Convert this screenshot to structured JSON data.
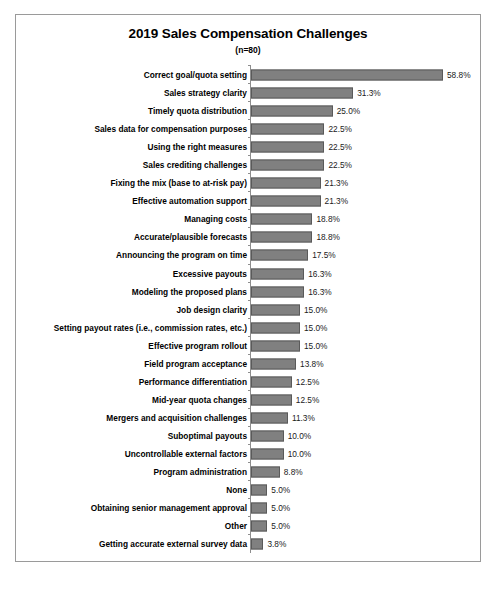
{
  "chart_data": {
    "type": "bar",
    "orientation": "horizontal",
    "title": "2019 Sales Compensation Challenges",
    "subtitle": "(n=80)",
    "xlabel": "",
    "ylabel": "",
    "xlim": [
      0,
      58.8
    ],
    "grid": false,
    "legend": null,
    "value_suffix": "%",
    "categories": [
      "Correct goal/quota setting",
      "Sales strategy clarity",
      "Timely quota distribution",
      "Sales data for compensation purposes",
      "Using the right measures",
      "Sales crediting challenges",
      "Fixing the mix (base to at-risk pay)",
      "Effective automation support",
      "Managing costs",
      "Accurate/plausible forecasts",
      "Announcing the program on time",
      "Excessive payouts",
      "Modeling the proposed plans",
      "Job design clarity",
      "Setting payout rates (i.e., commission rates, etc.)",
      "Effective program rollout",
      "Field program acceptance",
      "Performance differentiation",
      "Mid-year quota changes",
      "Mergers and acquisition challenges",
      "Suboptimal payouts",
      "Uncontrollable external factors",
      "Program administration",
      "None",
      "Obtaining senior management approval",
      "Other",
      "Getting accurate external survey data"
    ],
    "values": [
      58.8,
      31.3,
      25.0,
      22.5,
      22.5,
      22.5,
      21.3,
      21.3,
      18.8,
      18.8,
      17.5,
      16.3,
      16.3,
      15.0,
      15.0,
      15.0,
      13.8,
      12.5,
      12.5,
      11.3,
      10.0,
      10.0,
      8.8,
      5.0,
      5.0,
      5.0,
      3.8
    ],
    "value_labels": [
      "58.8%",
      "31.3%",
      "25.0%",
      "22.5%",
      "22.5%",
      "22.5%",
      "21.3%",
      "21.3%",
      "18.8%",
      "18.8%",
      "17.5%",
      "16.3%",
      "16.3%",
      "15.0%",
      "15.0%",
      "15.0%",
      "13.8%",
      "12.5%",
      "12.5%",
      "11.3%",
      "10.0%",
      "10.0%",
      "8.8%",
      "5.0%",
      "5.0%",
      "5.0%",
      "3.8%"
    ]
  },
  "style": {
    "bar_fill": "#808080",
    "bar_border": "#5a5a5a",
    "axis_color": "#8d8d8d",
    "frame_color": "#9a9a9a",
    "text_color": "#000000",
    "background": "#ffffff"
  }
}
